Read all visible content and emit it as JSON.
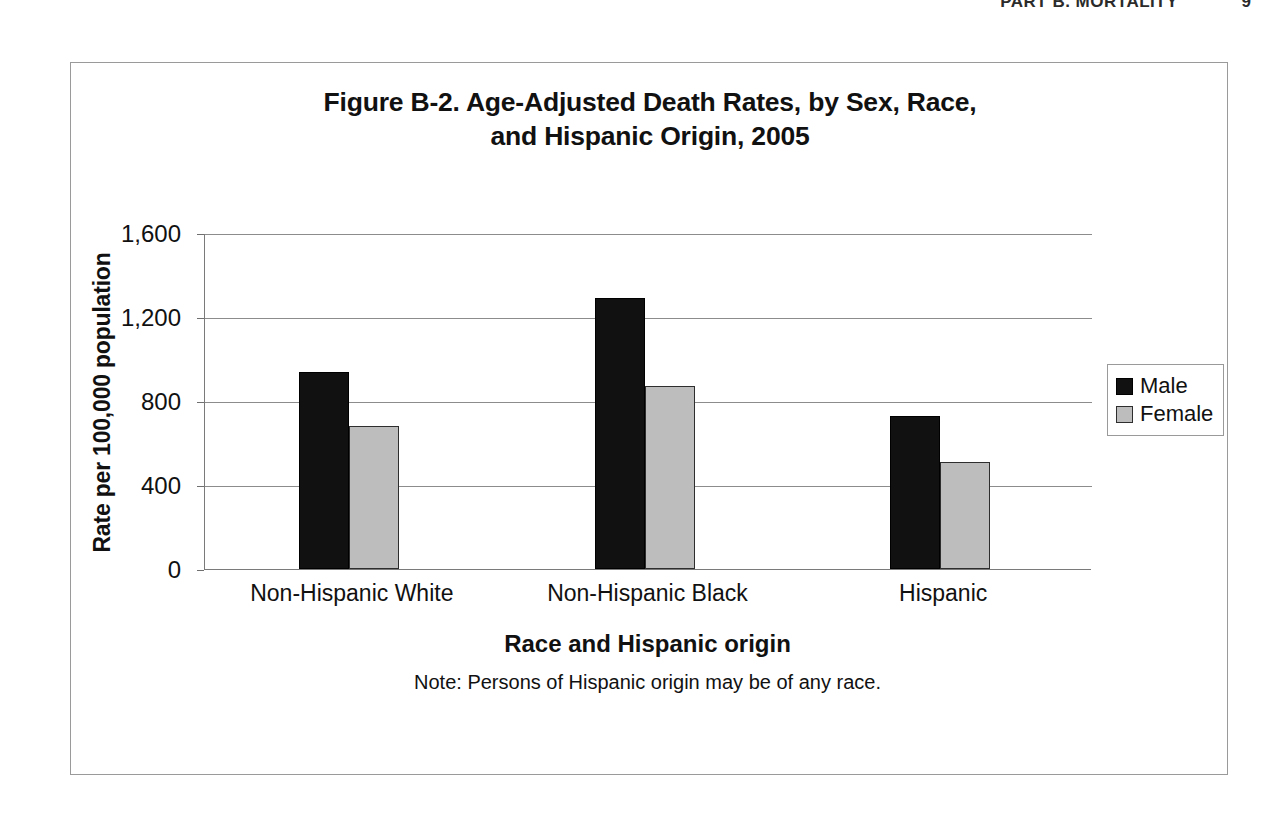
{
  "page_header": {
    "title": "PART B. MORTALITY",
    "page_number": "9"
  },
  "figure": {
    "title_line1": "Figure B-2. Age-Adjusted Death Rates, by Sex, Race,",
    "title_line2": "and Hispanic Origin, 2005",
    "note": "Note: Persons of Hispanic origin may be of any race."
  },
  "legend": {
    "position": "right",
    "items": [
      {
        "label": "Male",
        "color": "#111111"
      },
      {
        "label": "Female",
        "color": "#bdbdbd"
      }
    ]
  },
  "chart_data": {
    "type": "bar",
    "title": "Figure B-2. Age-Adjusted Death Rates, by Sex, Race, and Hispanic Origin, 2005",
    "xlabel": "Race and Hispanic origin",
    "ylabel": "Rate per 100,000 population",
    "categories": [
      "Non-Hispanic White",
      "Non-Hispanic Black",
      "Hispanic"
    ],
    "series": [
      {
        "name": "Male",
        "color": "#111111",
        "values": [
          940,
          1290,
          730
        ]
      },
      {
        "name": "Female",
        "color": "#bdbdbd",
        "values": [
          680,
          870,
          510
        ]
      }
    ],
    "ylim": [
      0,
      1600
    ],
    "yticks": [
      0,
      400,
      800,
      1200,
      1600
    ],
    "ytick_labels": [
      "0",
      "400",
      "800",
      "1,200",
      "1,600"
    ],
    "grid": true,
    "legend_position": "right",
    "note": "Note: Persons of Hispanic origin may be of any race."
  }
}
